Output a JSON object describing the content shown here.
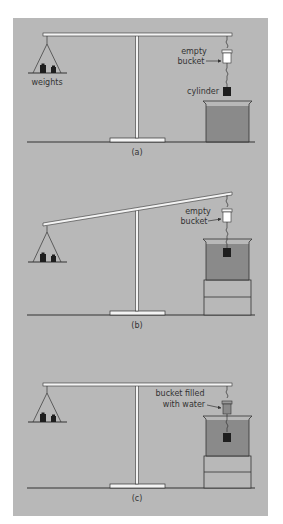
{
  "figure": {
    "background_color": "#b8b8b8",
    "page_color": "#ffffff",
    "line_color": "#333333",
    "beam_color": "#f4f4f4",
    "water_color": "#8a8a8a",
    "block_color": "#1e1e1e"
  },
  "panels": [
    {
      "caption": "(a)",
      "labels": {
        "weights": "weights",
        "bucket_line1": "empty",
        "bucket_line2": "bucket",
        "cylinder": "cylinder"
      },
      "state": "balanced, cylinder hanging in air above beaker"
    },
    {
      "caption": "(b)",
      "labels": {
        "bucket_line1": "empty",
        "bucket_line2": "bucket"
      },
      "state": "beam tilted, cylinder submerged in water"
    },
    {
      "caption": "(c)",
      "labels": {
        "bucket_line1": "bucket filled",
        "bucket_line2": "with water"
      },
      "state": "balanced again, bucket filled with water, cylinder submerged"
    }
  ]
}
